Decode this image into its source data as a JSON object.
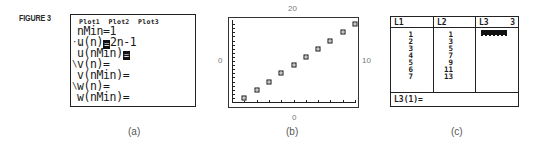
{
  "figure_label": "FIGURE 3",
  "captions": {
    "a": "(a)",
    "b": "(b)",
    "c": "(c)"
  },
  "panel_a": {
    "plots_header": "Plot1  Plot2  Plot3",
    "lines": [
      {
        "mark": "",
        "text": "nMin=1",
        "highlight": false
      },
      {
        "mark": "·.",
        "prefix": "u(n)",
        "highlight_char": "=",
        "suffix": "2n-1"
      },
      {
        "mark": "",
        "prefix": "u(nMin)",
        "highlight_char": "=",
        "suffix": ""
      },
      {
        "mark": "\\",
        "text": "v(n)="
      },
      {
        "mark": "",
        "text": "v(nMin)="
      },
      {
        "mark": "\\",
        "text": "w(n)="
      },
      {
        "mark": "",
        "text": "w(nMin)="
      }
    ]
  },
  "panel_b": {
    "label_top": "20",
    "label_left": "0",
    "label_right": "10",
    "label_bottom": "0"
  },
  "panel_c": {
    "headers": {
      "l1": "L1",
      "l2": "L2",
      "l3": "L3",
      "col_index": "3"
    },
    "L1": [
      "1",
      "2",
      "3",
      "4",
      "5",
      "6",
      "7"
    ],
    "L2": [
      "1",
      "3",
      "5",
      "7",
      "9",
      "11",
      "13"
    ],
    "footer": "L3(1)="
  },
  "chart_data": {
    "type": "scatter",
    "title": "",
    "xlabel": "n",
    "ylabel": "u(n)",
    "x": [
      1,
      2,
      3,
      4,
      5,
      6,
      7,
      8,
      9,
      10
    ],
    "values": [
      1,
      3,
      5,
      7,
      9,
      11,
      13,
      15,
      17,
      19
    ],
    "xlim": [
      0,
      10
    ],
    "ylim": [
      0,
      20
    ],
    "window_labels": {
      "xmin": "0",
      "xmax": "10",
      "ymin": "0",
      "ymax": "20"
    },
    "grid": false,
    "legend": null
  }
}
